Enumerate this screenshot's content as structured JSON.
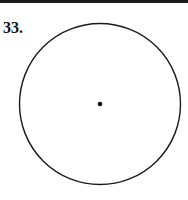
{
  "problem": {
    "number_label": "33."
  },
  "figure": {
    "type": "circle-with-center-point",
    "circle": {
      "cx": 100,
      "cy": 104,
      "r": 80.5,
      "stroke": "#1a1a1a"
    },
    "center_point": {
      "cx": 100,
      "cy": 104,
      "r": 2.3,
      "fill": "#111111"
    }
  }
}
